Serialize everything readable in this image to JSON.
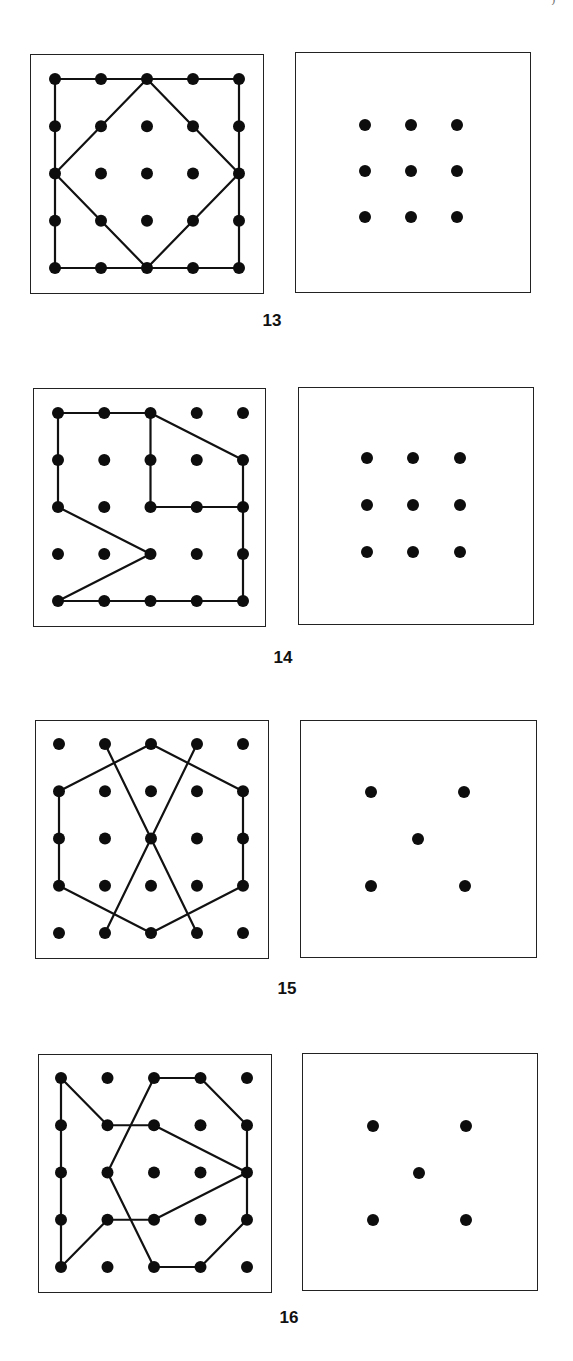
{
  "header": {
    "left_fragment": "",
    "right_fragment": ")"
  },
  "puzzles": [
    {
      "number": "13",
      "label_pos": [
        272,
        322
      ],
      "left_board": {
        "box": [
          30,
          54,
          234,
          240
        ],
        "grid_origin": [
          55,
          79
        ],
        "step": [
          46,
          47.25
        ],
        "paths": [
          {
            "closed": true,
            "points": [
              [
                0,
                0
              ],
              [
                4,
                0
              ],
              [
                4,
                4
              ],
              [
                0,
                4
              ]
            ]
          },
          {
            "closed": true,
            "points": [
              [
                2,
                0
              ],
              [
                4,
                2
              ],
              [
                2,
                4
              ],
              [
                0,
                2
              ]
            ]
          }
        ]
      },
      "right_board": {
        "box": [
          295,
          52,
          236,
          241
        ],
        "dots": [
          [
            365,
            125
          ],
          [
            411,
            125
          ],
          [
            457,
            125
          ],
          [
            365,
            171
          ],
          [
            411,
            171
          ],
          [
            457,
            171
          ],
          [
            365,
            217
          ],
          [
            411,
            217
          ],
          [
            457,
            217
          ]
        ]
      }
    },
    {
      "number": "14",
      "label_pos": [
        283,
        659
      ],
      "left_board": {
        "box": [
          33,
          388,
          233,
          239
        ],
        "grid_origin": [
          58,
          413
        ],
        "step": [
          46.25,
          47
        ],
        "paths": [
          {
            "closed": true,
            "points": [
              [
                0,
                0
              ],
              [
                2,
                0
              ],
              [
                4,
                1
              ],
              [
                4,
                4
              ],
              [
                0,
                4
              ],
              [
                2,
                3
              ],
              [
                0,
                2
              ]
            ]
          },
          {
            "closed": false,
            "points": [
              [
                2,
                0
              ],
              [
                2,
                2
              ],
              [
                4,
                2
              ]
            ]
          }
        ]
      },
      "right_board": {
        "box": [
          298,
          387,
          236,
          238
        ],
        "dots": [
          [
            367,
            458
          ],
          [
            413,
            458
          ],
          [
            460,
            458
          ],
          [
            367,
            505
          ],
          [
            413,
            505
          ],
          [
            460,
            505
          ],
          [
            367,
            552
          ],
          [
            413,
            552
          ],
          [
            460,
            552
          ]
        ]
      }
    },
    {
      "number": "15",
      "label_pos": [
        287,
        990
      ],
      "left_board": {
        "box": [
          35,
          720,
          234,
          239
        ],
        "grid_origin": [
          59,
          744
        ],
        "step": [
          46,
          47.25
        ],
        "paths": [
          {
            "closed": true,
            "points": [
              [
                2,
                0
              ],
              [
                4,
                1
              ],
              [
                4,
                3
              ],
              [
                2,
                4
              ],
              [
                0,
                3
              ],
              [
                0,
                1
              ]
            ]
          },
          {
            "closed": false,
            "points": [
              [
                1,
                0
              ],
              [
                3,
                4
              ]
            ]
          },
          {
            "closed": false,
            "points": [
              [
                3,
                0
              ],
              [
                1,
                4
              ]
            ]
          }
        ]
      },
      "right_board": {
        "box": [
          300,
          720,
          237,
          238
        ],
        "dots": [
          [
            371,
            792
          ],
          [
            464,
            792
          ],
          [
            418,
            839
          ],
          [
            371,
            886
          ],
          [
            465,
            886
          ]
        ]
      }
    },
    {
      "number": "16",
      "label_pos": [
        289,
        1319
      ],
      "left_board": {
        "box": [
          38,
          1054,
          234,
          239
        ],
        "grid_origin": [
          61,
          1078
        ],
        "step": [
          46.5,
          47.25
        ],
        "paths": [
          {
            "closed": true,
            "points": [
              [
                0,
                0
              ],
              [
                1,
                1
              ],
              [
                2,
                1
              ],
              [
                4,
                2
              ],
              [
                2,
                3
              ],
              [
                1,
                3
              ],
              [
                0,
                4
              ]
            ]
          },
          {
            "closed": true,
            "points": [
              [
                2,
                0
              ],
              [
                3,
                0
              ],
              [
                4,
                1
              ],
              [
                4,
                3
              ],
              [
                3,
                4
              ],
              [
                2,
                4
              ],
              [
                1,
                2
              ]
            ]
          }
        ]
      },
      "right_board": {
        "box": [
          302,
          1053,
          236,
          238
        ],
        "dots": [
          [
            373,
            1126
          ],
          [
            466,
            1126
          ],
          [
            419,
            1173
          ],
          [
            373,
            1220
          ],
          [
            466,
            1220
          ]
        ]
      }
    }
  ],
  "grid_size": 5,
  "colors": {
    "ink": "#111111",
    "dot": "#0d0d0d",
    "paper": "#ffffff"
  }
}
